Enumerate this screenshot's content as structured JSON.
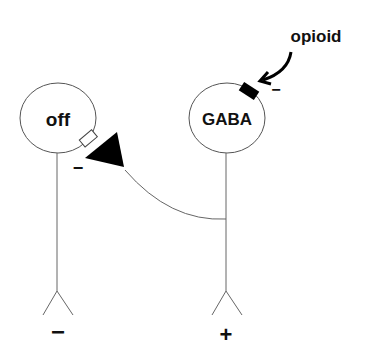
{
  "diagram": {
    "neurons": [
      {
        "id": "off",
        "label": "off",
        "output_sign": "−"
      },
      {
        "id": "gaba",
        "label": "GABA",
        "output_sign": "+"
      }
    ],
    "opioid": {
      "label": "opioid",
      "effect_sign": "−"
    },
    "synapse": {
      "sign": "−"
    },
    "colors": {
      "line": "#555555",
      "fill": "#000000",
      "background": "#ffffff"
    }
  }
}
